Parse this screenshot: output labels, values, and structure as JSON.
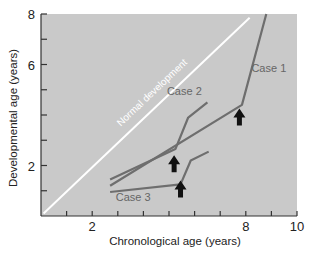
{
  "chart_data": {
    "type": "line",
    "title": "",
    "xlabel": "Chronological age (years)",
    "ylabel": "Developmental age (years)",
    "xlim": [
      0,
      10
    ],
    "ylim": [
      0,
      8
    ],
    "x_ticks": [
      1,
      2,
      3,
      4,
      5,
      6,
      7,
      8,
      9,
      10
    ],
    "x_tick_labels": [
      {
        "value": 2,
        "label": "2"
      },
      {
        "value": 8,
        "label": "8"
      },
      {
        "value": 10,
        "label": "10"
      }
    ],
    "y_ticks": [
      1,
      2,
      3,
      4,
      5,
      6,
      7,
      8
    ],
    "y_tick_labels": [
      {
        "value": 2,
        "label": "2"
      },
      {
        "value": 6,
        "label": "6"
      },
      {
        "value": 8,
        "label": "8"
      }
    ],
    "grid": false,
    "background": "#c9c9c9",
    "series": [
      {
        "name": "Normal development",
        "color": "#ffffff",
        "points": [
          [
            0.1,
            0.1
          ],
          [
            8.15,
            7.85
          ]
        ]
      },
      {
        "name": "Case 1",
        "color": "#6e6e6e",
        "points": [
          [
            2.7,
            1.2
          ],
          [
            7.85,
            4.4
          ],
          [
            8.8,
            8.0
          ]
        ]
      },
      {
        "name": "Case 2",
        "color": "#6e6e6e",
        "points": [
          [
            2.7,
            1.45
          ],
          [
            5.25,
            2.65
          ],
          [
            5.75,
            3.9
          ],
          [
            6.5,
            4.5
          ]
        ]
      },
      {
        "name": "Case 3",
        "color": "#6e6e6e",
        "points": [
          [
            2.7,
            0.95
          ],
          [
            5.45,
            1.25
          ],
          [
            5.85,
            2.2
          ],
          [
            6.55,
            2.55
          ]
        ]
      }
    ],
    "annotations": [
      {
        "type": "label",
        "text": "Normal development",
        "series": "Normal development"
      },
      {
        "type": "label",
        "text": "Case 1",
        "x": 8.9,
        "y": 5.7
      },
      {
        "type": "label",
        "text": "Case 2",
        "x": 5.6,
        "y": 4.8
      },
      {
        "type": "label",
        "text": "Case 3",
        "x": 3.6,
        "y": 0.6
      },
      {
        "type": "arrow",
        "direction": "up",
        "x": 7.75,
        "y": 3.9,
        "note": "treatment onset"
      },
      {
        "type": "arrow",
        "direction": "up",
        "x": 5.2,
        "y": 2.05
      },
      {
        "type": "arrow",
        "direction": "up",
        "x": 5.45,
        "y": 1.05
      }
    ]
  }
}
